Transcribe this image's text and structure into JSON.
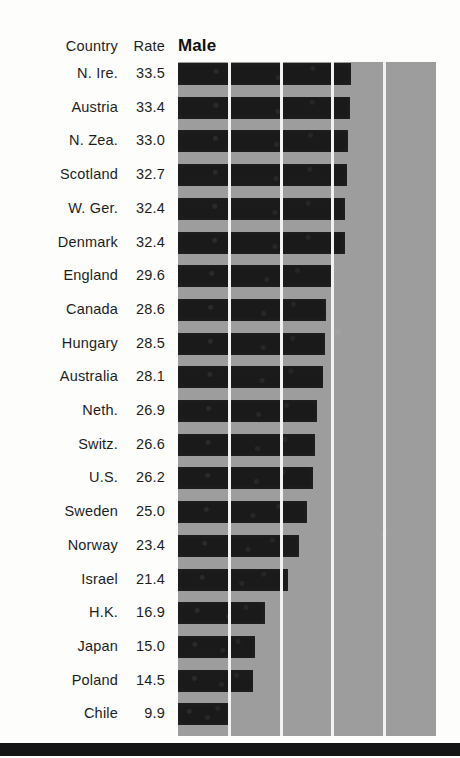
{
  "table": {
    "country_header": "Country",
    "rate_header": "Rate"
  },
  "colors": {
    "plot_background": "#9d9d9d",
    "bar": "#1a1a1a",
    "gridline": "#f2f2f0",
    "text": "#1d1d1d",
    "rule": "#141414",
    "page_background": "#fdfdfc"
  },
  "chart_data": {
    "type": "bar",
    "orientation": "horizontal",
    "title": "Male",
    "xlabel": "",
    "ylabel": "",
    "legend": [],
    "grid": true,
    "gridlines_x": [
      10,
      20,
      30,
      40
    ],
    "xlim": [
      0,
      50
    ],
    "categories": [
      "N. Ire.",
      "Austria",
      "N. Zea.",
      "Scotland",
      "W. Ger.",
      "Denmark",
      "England",
      "Canada",
      "Hungary",
      "Australia",
      "Neth.",
      "Switz.",
      "U.S.",
      "Sweden",
      "Norway",
      "Israel",
      "H.K.",
      "Japan",
      "Poland",
      "Chile"
    ],
    "values": [
      33.5,
      33.4,
      33.0,
      32.7,
      32.4,
      32.4,
      29.6,
      28.6,
      28.5,
      28.1,
      26.9,
      26.6,
      26.2,
      25.0,
      23.4,
      21.4,
      16.9,
      15.0,
      14.5,
      9.9
    ],
    "value_labels": [
      "33.5",
      "33.4",
      "33.0",
      "32.7",
      "32.4",
      "32.4",
      "29.6",
      "28.6",
      "28.5",
      "28.1",
      "26.9",
      "26.6",
      "26.2",
      "25.0",
      "23.4",
      "21.4",
      "16.9",
      "15.0",
      "14.5",
      "9.9"
    ]
  }
}
